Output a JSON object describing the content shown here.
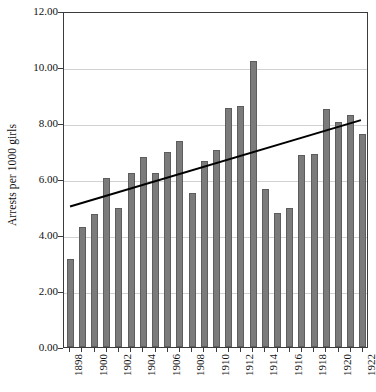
{
  "chart_data": {
    "type": "bar",
    "title": "",
    "xlabel": "",
    "ylabel": "Arrests per 1000 girls",
    "ylim": [
      0.0,
      12.0
    ],
    "ytick_labels": [
      "12.00",
      "10.00",
      "8.00",
      "6.00",
      "4.00",
      "2.00",
      "0.00"
    ],
    "ytick_values": [
      12,
      10,
      8,
      6,
      4,
      2,
      0
    ],
    "grid": true,
    "legend": "none",
    "categories": [
      "1898",
      "1899",
      "1900",
      "1901",
      "1902",
      "1903",
      "1904",
      "1905",
      "1906",
      "1907",
      "1908",
      "1909",
      "1910",
      "1911",
      "1912",
      "1913",
      "1914",
      "1915",
      "1916",
      "1917",
      "1918",
      "1919",
      "1920",
      "1921",
      "1922"
    ],
    "xtick_labels_shown": [
      "1898",
      "1900",
      "1902",
      "1904",
      "1906",
      "1908",
      "1910",
      "1912",
      "1914",
      "1916",
      "1918",
      "1920",
      "1922"
    ],
    "values": [
      3.15,
      4.3,
      4.75,
      6.05,
      4.95,
      6.2,
      6.8,
      6.2,
      6.95,
      7.35,
      5.5,
      6.65,
      7.05,
      8.55,
      8.6,
      10.2,
      5.65,
      4.8,
      4.95,
      6.85,
      6.9,
      8.5,
      8.05,
      8.3,
      7.6
    ],
    "series": [
      {
        "name": "Arrests per 1000 girls",
        "values": [
          3.15,
          4.3,
          4.75,
          6.05,
          4.95,
          6.2,
          6.8,
          6.2,
          6.95,
          7.35,
          5.5,
          6.65,
          7.05,
          8.55,
          8.6,
          10.2,
          5.65,
          4.8,
          4.95,
          6.85,
          6.9,
          8.5,
          8.05,
          8.3,
          7.6
        ]
      }
    ],
    "trendline": {
      "type": "linear",
      "start": {
        "x": "1898",
        "y": 5.05
      },
      "end": {
        "x": "1922",
        "y": 8.15
      }
    },
    "colors": {
      "bar_fill": "#7b7b7b",
      "bar_stroke": "#5d5d5d",
      "trendline": "#000000",
      "gridline": "#d2d2d2",
      "axis": "#3b3b3b",
      "text": "#101010",
      "background": "#ffffff"
    }
  }
}
